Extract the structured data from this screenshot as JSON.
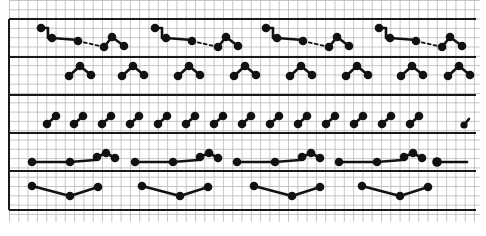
{
  "diagram": {
    "title": "",
    "colors": {
      "background": "#ffffff",
      "grid_fine": "#b8b8b8",
      "grid_thick": "#1a1a1a",
      "ink": "#111111"
    },
    "grid": {
      "x0": 9,
      "x1": 480,
      "y0": 0,
      "y1": 222,
      "spacing": 9.3,
      "thick_rows_y": [
        19,
        57,
        95,
        133,
        171,
        210
      ],
      "thick_left_x": 9,
      "thick_right_x": 476
    },
    "bands": [
      {
        "name": "band-1",
        "motif_offsets_x": [
          0,
          114,
          225,
          338
        ],
        "motif": {
          "solid": [
            [
              41,
              28
            ],
            [
              48,
              28
            ],
            [
              48,
              38
            ],
            [
              52,
              38
            ],
            [
              78,
              40
            ]
          ],
          "dots": [
            [
              41,
              28
            ],
            [
              52,
              38
            ],
            [
              78,
              41
            ],
            [
              104,
              47
            ],
            [
              112,
              37
            ],
            [
              124,
              46
            ]
          ],
          "dashed": [
            [
              78,
              41
            ],
            [
              104,
              47
            ]
          ],
          "solid2": [
            [
              104,
              47
            ],
            [
              112,
              37
            ],
            [
              124,
              46
            ]
          ]
        }
      },
      {
        "name": "band-2",
        "motif_starts_x": [
          69,
          122,
          178,
          234,
          290,
          346,
          401,
          448
        ],
        "motif": {
          "points": [
            [
              0,
              10
            ],
            [
              11,
              0
            ],
            [
              22,
              9
            ]
          ]
        }
      },
      {
        "name": "band-3",
        "pair_starts_x": [
          47,
          74,
          102,
          130,
          158,
          186,
          214,
          242,
          270,
          298,
          326,
          354,
          382,
          410,
          437
        ],
        "pair": {
          "points": [
            [
              0,
              8
            ],
            [
              9,
              0
            ]
          ]
        },
        "final_partial": true
      },
      {
        "name": "band-4",
        "motif_offsets_x": [
          0,
          103,
          205,
          307
        ],
        "motif": {
          "points": [
            [
              32,
              162
            ],
            [
              70,
              162
            ],
            [
              95,
              160
            ],
            [
              97,
              157
            ],
            [
              106,
              153
            ],
            [
              115,
              158
            ]
          ]
        },
        "trailing": {
          "dot": [
            437,
            162
          ],
          "line_to": [
            467,
            162
          ]
        }
      },
      {
        "name": "band-5",
        "motif_offsets_x": [
          0,
          110,
          222,
          330
        ],
        "motif": {
          "points": [
            [
              32,
              186
            ],
            [
              70,
              196
            ],
            [
              98,
              187
            ]
          ]
        }
      }
    ]
  }
}
